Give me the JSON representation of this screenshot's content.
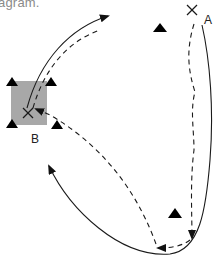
{
  "caption": {
    "text": "agram."
  },
  "diagram": {
    "type": "navigation-paths",
    "colors": {
      "background": "#ffffff",
      "region": "#a8a8a8",
      "stroke": "#1a1a1a",
      "landmark": "#000000"
    },
    "points": [
      {
        "id": "A",
        "label": "A",
        "marker": "x",
        "x": 192,
        "y": 10,
        "label_x": 204,
        "label_y": 24
      },
      {
        "id": "B",
        "label": "B",
        "marker": "x",
        "x": 28,
        "y": 113,
        "label_x": 31,
        "label_y": 142
      }
    ],
    "region": {
      "around": "B",
      "x": 10,
      "y": 80,
      "width": 37,
      "height": 45
    },
    "landmarks": [
      {
        "shape": "triangle",
        "x": 12,
        "y": 79
      },
      {
        "shape": "triangle",
        "x": 51,
        "y": 79
      },
      {
        "shape": "triangle",
        "x": 12,
        "y": 120
      },
      {
        "shape": "triangle",
        "x": 57,
        "y": 121
      },
      {
        "shape": "triangle",
        "x": 160,
        "y": 28
      },
      {
        "shape": "triangle",
        "x": 175,
        "y": 213
      }
    ],
    "paths": [
      {
        "name": "outbound-from-B-solid",
        "style": "solid",
        "from": "B",
        "direction": "up-right"
      },
      {
        "name": "outbound-from-B-dashed",
        "style": "dashed",
        "from": "B",
        "direction": "up-right"
      },
      {
        "name": "loop-from-A-solid",
        "style": "solid",
        "from": "A",
        "direction": "down then up-left toward B"
      },
      {
        "name": "return-from-A-dashed",
        "style": "dashed",
        "from": "A",
        "to": "B"
      }
    ]
  }
}
